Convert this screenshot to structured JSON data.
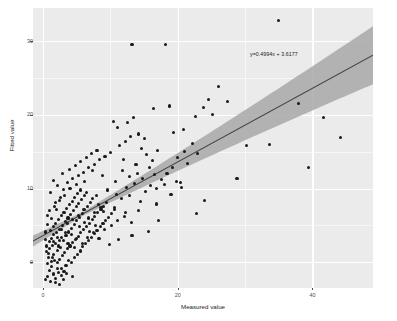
{
  "chart_data": {
    "type": "scatter",
    "title": "",
    "xlabel": "Measured value",
    "ylabel": "Fitted value",
    "xlim": [
      -1.5,
      49.0
    ],
    "ylim": [
      -3.5,
      34.5
    ],
    "xticks": [
      0,
      20,
      40
    ],
    "xtick_labels": [
      "0",
      "20",
      "40"
    ],
    "yticks": [
      0,
      10,
      20,
      30
    ],
    "ytick_labels": [
      "0",
      "10",
      "20",
      "30"
    ],
    "grid": true,
    "legend": "none",
    "annotation": "y=0.4994x + 3.6177",
    "fit": {
      "slope": 0.4994,
      "intercept": 3.6177,
      "band": "confidence interval ribbon",
      "line_color": "#3f3f3f",
      "band_color": "#a3a3a3"
    },
    "panel_color": "#ebebeb",
    "gridline_color": "#ffffff",
    "point_color": "#1a1a1a",
    "points": [
      [
        0.4,
        -2.3
      ],
      [
        0.7,
        -1.9
      ],
      [
        1.1,
        -2.6
      ],
      [
        1.5,
        -1.6
      ],
      [
        0.9,
        -1.1
      ],
      [
        1.9,
        -2.2
      ],
      [
        2.3,
        -1.4
      ],
      [
        1.3,
        -0.6
      ],
      [
        0.6,
        -0.2
      ],
      [
        2.7,
        -1.8
      ],
      [
        1.7,
        0.2
      ],
      [
        2.1,
        -0.8
      ],
      [
        3.1,
        -1.2
      ],
      [
        0.8,
        0.6
      ],
      [
        1.2,
        0.1
      ],
      [
        2.5,
        0.4
      ],
      [
        3.4,
        -0.4
      ],
      [
        1.6,
        1.0
      ],
      [
        0.5,
        1.4
      ],
      [
        2.9,
        0.9
      ],
      [
        3.8,
        0.2
      ],
      [
        1.0,
        1.9
      ],
      [
        2.2,
        1.6
      ],
      [
        4.2,
        -0.1
      ],
      [
        1.4,
        2.3
      ],
      [
        3.2,
        1.3
      ],
      [
        2.6,
        2.0
      ],
      [
        0.9,
        2.8
      ],
      [
        4.6,
        0.7
      ],
      [
        1.8,
        2.6
      ],
      [
        3.6,
        1.8
      ],
      [
        2.4,
        2.9
      ],
      [
        5.1,
        1.1
      ],
      [
        1.2,
        3.2
      ],
      [
        4.0,
        2.2
      ],
      [
        2.8,
        3.4
      ],
      [
        5.5,
        1.6
      ],
      [
        1.6,
        3.7
      ],
      [
        3.0,
        3.0
      ],
      [
        4.4,
        2.7
      ],
      [
        2.0,
        4.0
      ],
      [
        5.9,
        2.1
      ],
      [
        3.4,
        3.6
      ],
      [
        1.1,
        4.3
      ],
      [
        4.8,
        3.1
      ],
      [
        2.5,
        4.5
      ],
      [
        6.3,
        2.6
      ],
      [
        3.8,
        4.1
      ],
      [
        1.5,
        4.8
      ],
      [
        5.2,
        3.5
      ],
      [
        2.9,
        5.0
      ],
      [
        6.8,
        3.0
      ],
      [
        4.2,
        4.6
      ],
      [
        1.9,
        5.3
      ],
      [
        5.6,
        4.0
      ],
      [
        3.3,
        5.5
      ],
      [
        7.2,
        3.4
      ],
      [
        4.6,
        5.1
      ],
      [
        2.3,
        5.8
      ],
      [
        6.0,
        4.4
      ],
      [
        3.7,
        6.0
      ],
      [
        7.6,
        3.9
      ],
      [
        5.0,
        5.6
      ],
      [
        2.7,
        6.3
      ],
      [
        6.4,
        4.9
      ],
      [
        4.1,
        6.5
      ],
      [
        8.0,
        4.3
      ],
      [
        5.4,
        6.1
      ],
      [
        3.1,
        6.8
      ],
      [
        6.9,
        5.3
      ],
      [
        4.5,
        7.0
      ],
      [
        8.5,
        4.8
      ],
      [
        5.8,
        6.6
      ],
      [
        3.5,
        7.3
      ],
      [
        7.3,
        5.8
      ],
      [
        4.9,
        7.5
      ],
      [
        8.9,
        5.2
      ],
      [
        6.2,
        7.1
      ],
      [
        3.9,
        7.8
      ],
      [
        7.7,
        6.2
      ],
      [
        5.3,
        8.0
      ],
      [
        9.3,
        5.7
      ],
      [
        6.6,
        7.6
      ],
      [
        4.3,
        8.3
      ],
      [
        8.1,
        6.7
      ],
      [
        5.7,
        8.5
      ],
      [
        9.7,
        6.1
      ],
      [
        7.0,
        8.1
      ],
      [
        4.7,
        8.8
      ],
      [
        8.6,
        7.2
      ],
      [
        6.1,
        9.0
      ],
      [
        10.2,
        6.6
      ],
      [
        7.4,
        8.6
      ],
      [
        5.1,
        9.3
      ],
      [
        9.0,
        7.6
      ],
      [
        6.5,
        9.5
      ],
      [
        10.6,
        7.1
      ],
      [
        7.9,
        9.1
      ],
      [
        5.5,
        9.8
      ],
      [
        9.4,
        8.1
      ],
      [
        1.3,
        5.9
      ],
      [
        2.0,
        7.2
      ],
      [
        0.7,
        6.4
      ],
      [
        1.8,
        8.1
      ],
      [
        2.6,
        8.8
      ],
      [
        1.1,
        9.4
      ],
      [
        3.0,
        9.9
      ],
      [
        2.2,
        10.4
      ],
      [
        1.6,
        11.1
      ],
      [
        3.6,
        10.8
      ],
      [
        4.4,
        11.4
      ],
      [
        2.9,
        12.0
      ],
      [
        5.2,
        11.8
      ],
      [
        3.9,
        12.6
      ],
      [
        6.0,
        12.2
      ],
      [
        4.8,
        13.1
      ],
      [
        6.8,
        12.9
      ],
      [
        5.6,
        13.7
      ],
      [
        7.6,
        13.3
      ],
      [
        6.4,
        14.2
      ],
      [
        8.4,
        13.9
      ],
      [
        7.2,
        14.8
      ],
      [
        9.2,
        14.4
      ],
      [
        8.0,
        15.2
      ],
      [
        10.0,
        14.9
      ],
      [
        11.4,
        15.8
      ],
      [
        12.2,
        16.4
      ],
      [
        13.0,
        17.0
      ],
      [
        11.0,
        18.3
      ],
      [
        12.6,
        18.9
      ],
      [
        10.4,
        19.1
      ],
      [
        13.4,
        19.6
      ],
      [
        14.2,
        17.4
      ],
      [
        15.0,
        16.8
      ],
      [
        14.6,
        15.4
      ],
      [
        12.0,
        14.0
      ],
      [
        13.8,
        13.2
      ],
      [
        15.4,
        14.6
      ],
      [
        16.2,
        13.8
      ],
      [
        17.0,
        15.1
      ],
      [
        11.8,
        12.4
      ],
      [
        12.8,
        11.6
      ],
      [
        14.0,
        12.1
      ],
      [
        15.8,
        12.8
      ],
      [
        16.6,
        11.9
      ],
      [
        10.8,
        10.9
      ],
      [
        12.4,
        10.2
      ],
      [
        13.6,
        10.7
      ],
      [
        14.8,
        11.3
      ],
      [
        16.0,
        10.4
      ],
      [
        9.6,
        9.8
      ],
      [
        10.9,
        9.2
      ],
      [
        11.6,
        8.6
      ],
      [
        12.9,
        9.0
      ],
      [
        14.4,
        8.2
      ],
      [
        15.2,
        9.6
      ],
      [
        16.8,
        10.0
      ],
      [
        17.6,
        11.2
      ],
      [
        18.4,
        12.0
      ],
      [
        19.2,
        12.9
      ],
      [
        18.0,
        10.6
      ],
      [
        19.8,
        11.0
      ],
      [
        20.6,
        10.2
      ],
      [
        21.4,
        13.4
      ],
      [
        20.0,
        14.2
      ],
      [
        21.0,
        15.0
      ],
      [
        22.2,
        16.1
      ],
      [
        23.0,
        14.8
      ],
      [
        19.4,
        17.6
      ],
      [
        20.8,
        18.0
      ],
      [
        22.6,
        19.8
      ],
      [
        23.8,
        21.0
      ],
      [
        24.6,
        22.1
      ],
      [
        26.0,
        23.9
      ],
      [
        27.4,
        21.8
      ],
      [
        18.8,
        21.2
      ],
      [
        16.4,
        20.9
      ],
      [
        13.2,
        29.6
      ],
      [
        18.2,
        29.5
      ],
      [
        35.0,
        32.8
      ],
      [
        25.2,
        20.0
      ],
      [
        28.8,
        11.4
      ],
      [
        30.2,
        15.8
      ],
      [
        33.6,
        16.0
      ],
      [
        38.0,
        21.6
      ],
      [
        41.6,
        19.6
      ],
      [
        44.2,
        16.9
      ],
      [
        39.4,
        12.8
      ],
      [
        24.0,
        8.4
      ],
      [
        22.8,
        6.6
      ],
      [
        17.2,
        5.6
      ],
      [
        15.6,
        4.2
      ],
      [
        13.2,
        3.6
      ],
      [
        11.2,
        3.1
      ],
      [
        9.8,
        2.4
      ],
      [
        8.2,
        7.8
      ],
      [
        9.0,
        6.9
      ],
      [
        10.6,
        7.4
      ],
      [
        12.2,
        6.8
      ],
      [
        14.2,
        7.0
      ],
      [
        16.8,
        7.9
      ],
      [
        19.0,
        9.2
      ],
      [
        20.4,
        10.8
      ],
      [
        8.8,
        11.8
      ],
      [
        7.4,
        12.4
      ],
      [
        6.2,
        11.0
      ],
      [
        5.0,
        10.6
      ],
      [
        4.0,
        10.0
      ],
      [
        3.2,
        9.1
      ],
      [
        2.4,
        8.4
      ],
      [
        1.7,
        7.6
      ],
      [
        1.0,
        7.0
      ],
      [
        0.6,
        5.1
      ],
      [
        0.4,
        4.1
      ],
      [
        0.3,
        3.1
      ],
      [
        0.5,
        2.2
      ],
      [
        0.8,
        1.2
      ],
      [
        1.4,
        0.7
      ],
      [
        2.1,
        0.0
      ],
      [
        2.8,
        -0.9
      ],
      [
        3.5,
        -1.5
      ],
      [
        4.3,
        -2.0
      ],
      [
        1.9,
        -2.8
      ],
      [
        2.5,
        -3.0
      ],
      [
        3.0,
        -2.4
      ],
      [
        5.4,
        4.8
      ],
      [
        6.1,
        5.4
      ],
      [
        6.9,
        4.2
      ],
      [
        7.8,
        5.0
      ],
      [
        4.2,
        3.8
      ],
      [
        4.9,
        3.2
      ],
      [
        5.8,
        2.6
      ],
      [
        6.6,
        3.4
      ],
      [
        7.5,
        4.0
      ],
      [
        8.3,
        3.2
      ],
      [
        9.1,
        4.4
      ],
      [
        10.1,
        5.0
      ],
      [
        11.1,
        5.6
      ],
      [
        12.1,
        6.2
      ],
      [
        13.1,
        5.4
      ],
      [
        5.2,
        6.4
      ],
      [
        6.0,
        7.2
      ],
      [
        6.8,
        6.0
      ],
      [
        7.6,
        6.8
      ],
      [
        8.6,
        7.4
      ],
      [
        3.6,
        5.2
      ],
      [
        4.4,
        5.8
      ],
      [
        2.7,
        4.4
      ],
      [
        3.3,
        4.0
      ],
      [
        2.1,
        3.4
      ],
      [
        1.5,
        2.8
      ],
      [
        2.3,
        2.2
      ],
      [
        3.7,
        2.6
      ],
      [
        4.7,
        2.0
      ],
      [
        5.6,
        1.4
      ]
    ]
  },
  "annotation_label": "y=0.4994x + 3.6177",
  "axes": {
    "x_title": "Measured value",
    "y_title": "Fitted value",
    "x_tick_labels": [
      "0",
      "20",
      "40"
    ],
    "y_tick_labels": [
      "0",
      "10",
      "20",
      "30"
    ]
  }
}
